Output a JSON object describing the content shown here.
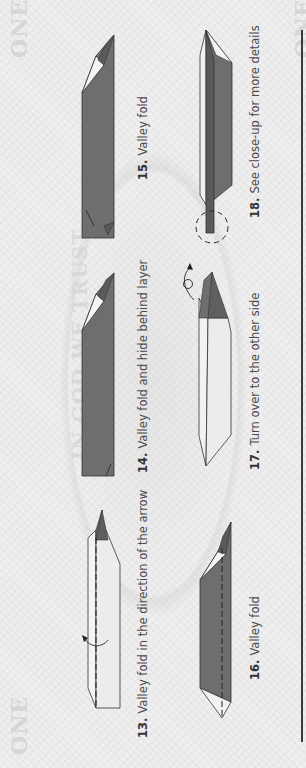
{
  "page": {
    "background": "dollar-bill-watermark",
    "watermark_texts": {
      "corner_word": "ONE",
      "motto": "IN GOD WE TRUST"
    },
    "colors": {
      "dark_paper": "#6e6e6e",
      "light_paper": "#ececec",
      "outline": "#333333",
      "label_text": "#4a4a4a",
      "rule": "#3a3a3a"
    }
  },
  "steps": [
    {
      "number": "13.",
      "text": "Valley fold in the direction of the arrow",
      "diagram": "valley-fold-arrow"
    },
    {
      "number": "14.",
      "text": "Valley fold and hide behind layer",
      "diagram": "valley-fold-hide"
    },
    {
      "number": "15.",
      "text": "Valley fold",
      "diagram": "valley-fold"
    },
    {
      "number": "16.",
      "text": "Valley fold",
      "diagram": "valley-fold-dashed"
    },
    {
      "number": "17.",
      "text": "Turn over to the other side",
      "diagram": "turn-over"
    },
    {
      "number": "18.",
      "text": "See close-up for more details",
      "diagram": "closeup-circle"
    }
  ]
}
